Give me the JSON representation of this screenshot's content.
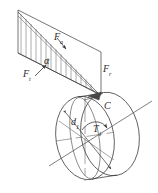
{
  "figure": {
    "type": "engineering-mechanics-free-body-diagram",
    "background_color": "#ffffff",
    "stroke_color": "#3a3a3a",
    "hatch_color": "#6b6b6b",
    "label_color": "#2b2b2b"
  },
  "labels": {
    "force_axial": {
      "symbol": "F",
      "subscript": "a"
    },
    "force_tangential": {
      "symbol": "F",
      "subscript": "t"
    },
    "force_radial": {
      "symbol": "F",
      "subscript": "r"
    },
    "angle": {
      "symbol": "α"
    },
    "point_c": {
      "symbol": "C"
    },
    "torque": {
      "symbol": "T",
      "subscript": "1"
    },
    "diameter": {
      "symbol": "d",
      "subscript": "1"
    }
  },
  "geometry": {
    "load_panel": {
      "name": "triangular-distributed-load-panel",
      "apex": [
        18,
        10
      ],
      "hatch_line_count": 11
    },
    "disk": {
      "name": "cylindrical-gear-disk",
      "front_face_center": [
        84,
        137
      ],
      "front_face_rx": 30,
      "front_face_ry": 43,
      "back_face_center": [
        112,
        133
      ],
      "back_face_rx": 30,
      "back_face_ry": 43
    }
  }
}
